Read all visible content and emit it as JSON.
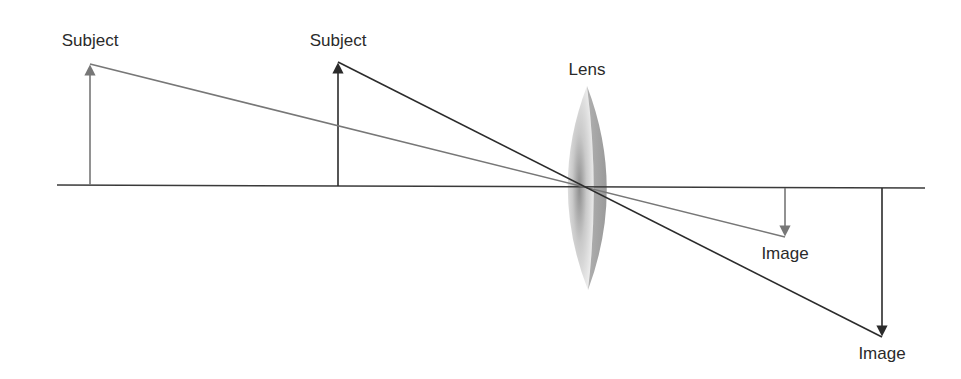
{
  "diagram": {
    "labels": {
      "subject_far": "Subject",
      "subject_near": "Subject",
      "lens": "Lens",
      "image_near": "Image",
      "image_far": "Image"
    },
    "colors": {
      "far_ray": "#777777",
      "near_ray": "#2b2b2b",
      "axis": "#3a3a3a",
      "lens_light": "#eeeeee",
      "lens_dark": "#9a9a9a"
    }
  }
}
